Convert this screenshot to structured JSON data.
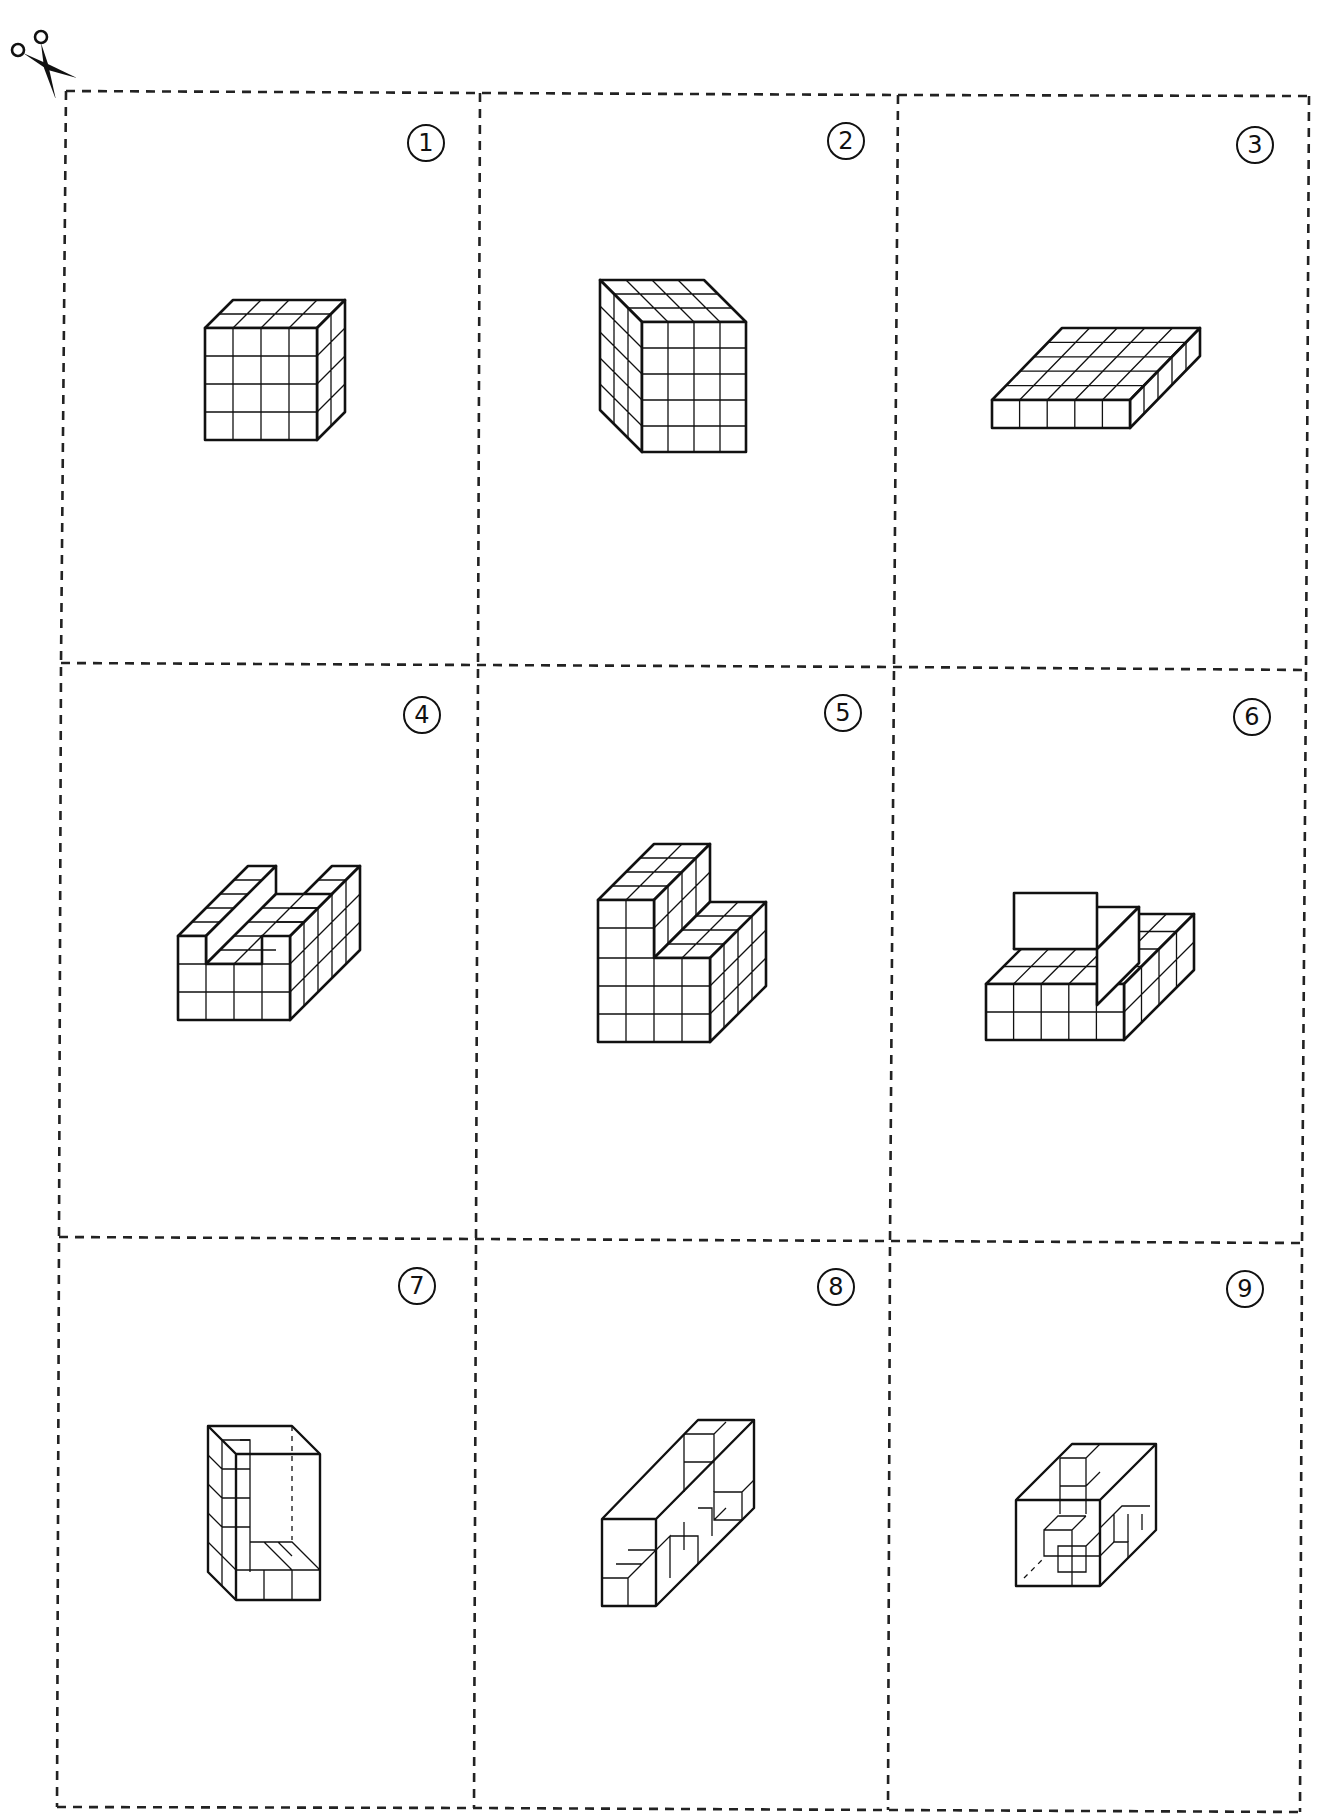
{
  "sheet": {
    "type": "cut-out cards",
    "cut_icon": "scissors-icon",
    "grid": {
      "rows": 3,
      "cols": 3
    }
  },
  "cards": [
    {
      "number": "1",
      "figure": "cuboid",
      "dims": {
        "width": 4,
        "height": 4,
        "depth": 2
      }
    },
    {
      "number": "2",
      "figure": "cuboid",
      "dims": {
        "width": 4,
        "height": 5,
        "depth": 3
      }
    },
    {
      "number": "3",
      "figure": "cuboid",
      "dims": {
        "width": 5,
        "height": 1,
        "depth": 5
      }
    },
    {
      "number": "4",
      "figure": "u-shape",
      "dims": {
        "width": 4,
        "height": 3,
        "depth": 5
      }
    },
    {
      "number": "5",
      "figure": "l-step",
      "dims": {
        "width": 4,
        "height": 5,
        "depth": 4
      }
    },
    {
      "number": "6",
      "figure": "two-tier",
      "dims": {
        "width": 5,
        "height": 4,
        "depth": 4
      }
    },
    {
      "number": "7",
      "figure": "open-box-partial",
      "dims": {
        "width": 3,
        "height": 5,
        "depth": 2
      }
    },
    {
      "number": "8",
      "figure": "open-box-partial",
      "dims": {
        "width": 2,
        "height": 2,
        "depth": 6
      }
    },
    {
      "number": "9",
      "figure": "open-box-partial",
      "dims": {
        "width": 3,
        "height": 3,
        "depth": 3
      }
    }
  ]
}
